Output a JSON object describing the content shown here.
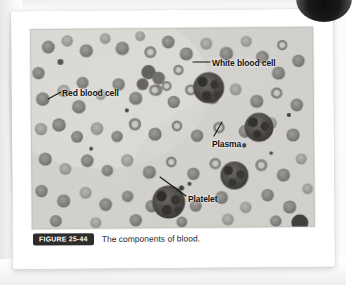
{
  "figure": {
    "badge_label": "FIGURE 25-44",
    "caption": "The components of blood.",
    "image_kind": "blood-smear-micrograph"
  },
  "annotations": [
    {
      "id": "white-blood-cell",
      "label": "White blood cell"
    },
    {
      "id": "red-blood-cell",
      "label": "Red blood cell"
    },
    {
      "id": "plasma",
      "label": "Plasma"
    },
    {
      "id": "platelet",
      "label": "Platelet"
    }
  ],
  "colors": {
    "page_background": "#ffffff",
    "scan_background": "#fcfcfc",
    "badge_background": "#2c2c2c",
    "badge_text": "#ffffff",
    "caption_text": "#2a2a2a",
    "label_text": "#121212",
    "micrograph_field": "#d8d6d2",
    "red_blood_cell": "#8b8a86",
    "white_blood_cell": "#4a4845",
    "leader_line": "#151515"
  }
}
